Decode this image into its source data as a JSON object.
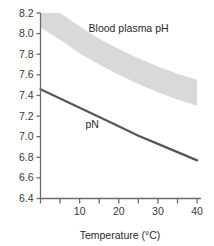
{
  "chart_data": {
    "type": "line",
    "title": "",
    "xlabel": "Temperature (°C)",
    "ylabel": "",
    "xlim": [
      0,
      41
    ],
    "ylim": [
      6.4,
      8.2
    ],
    "grid": false,
    "legend": "none",
    "xticks": [
      0,
      5,
      10,
      15,
      20,
      25,
      30,
      35,
      40
    ],
    "xticklabels": [
      "",
      "",
      "10",
      "",
      "20",
      "",
      "30",
      "",
      "40"
    ],
    "yticks": [
      6.4,
      6.6,
      6.8,
      7.0,
      7.2,
      7.4,
      7.6,
      7.8,
      8.0,
      8.2
    ],
    "yticklabels": [
      "6.4",
      "6.6",
      "6.8",
      "7.0",
      "7.2",
      "7.4",
      "7.6",
      "7.8",
      "8.0",
      "8.2"
    ],
    "series": [
      {
        "name": "Blood plasma pH",
        "kind": "band",
        "label": "Blood plasma pH",
        "color": "#d9d9d9",
        "x": [
          0,
          5,
          10,
          15,
          20,
          25,
          30,
          35,
          40
        ],
        "upper": [
          8.35,
          8.22,
          8.07,
          7.95,
          7.85,
          7.76,
          7.68,
          7.61,
          7.55
        ],
        "lower": [
          8.06,
          7.94,
          7.81,
          7.7,
          7.6,
          7.51,
          7.43,
          7.36,
          7.3
        ]
      },
      {
        "name": "pN",
        "kind": "line",
        "label": "pN",
        "color": "#575757",
        "x": [
          0,
          5,
          10,
          15,
          20,
          25,
          30,
          35,
          40
        ],
        "values": [
          7.46,
          7.37,
          7.28,
          7.19,
          7.1,
          7.01,
          6.93,
          6.85,
          6.77
        ]
      }
    ],
    "annotations": [
      {
        "text": "Blood plasma pH",
        "x": 22.5,
        "y": 8.02
      },
      {
        "text": "pN",
        "x": 13.2,
        "y": 7.08
      }
    ]
  },
  "axis_style": {
    "axis_color": "#6b6b6b",
    "tick_color": "#6b6b6b",
    "background": "#ffffff"
  }
}
